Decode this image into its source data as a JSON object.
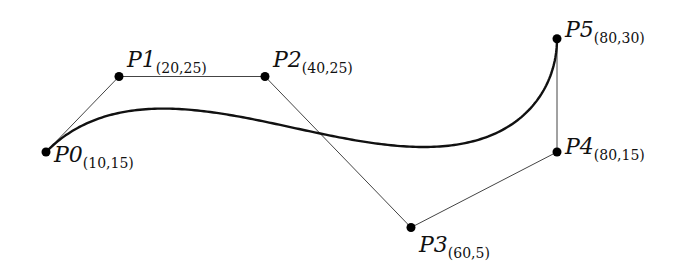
{
  "diagram": {
    "title": "",
    "type": "bezier-curve-with-control-polygon",
    "mapping": {
      "origin_px": [
        46,
        152
      ],
      "origin_units": [
        10,
        15
      ],
      "px_per_unit_x": 7.3,
      "px_per_unit_y": 7.55
    },
    "colors": {
      "curve": "#111111",
      "polygon": "#444444",
      "point": "#000000",
      "background": "#ffffff"
    },
    "points": [
      {
        "name": "P0",
        "coord": "(10,15)",
        "x": 10,
        "y": 15,
        "label_dx": 8,
        "label_dy": 10
      },
      {
        "name": "P1",
        "coord": "(20,25)",
        "x": 20,
        "y": 25,
        "label_dx": 8,
        "label_dy": -10
      },
      {
        "name": "P2",
        "coord": "(40,25)",
        "x": 40,
        "y": 25,
        "label_dx": 8,
        "label_dy": -10
      },
      {
        "name": "P3",
        "coord": "(60,5)",
        "x": 60,
        "y": 5,
        "label_dx": 8,
        "label_dy": 24
      },
      {
        "name": "P4",
        "coord": "(80,15)",
        "x": 80,
        "y": 15,
        "label_dx": 8,
        "label_dy": 2
      },
      {
        "name": "P5",
        "coord": "(80,30)",
        "x": 80,
        "y": 30,
        "label_dx": 8,
        "label_dy": -2
      }
    ]
  }
}
